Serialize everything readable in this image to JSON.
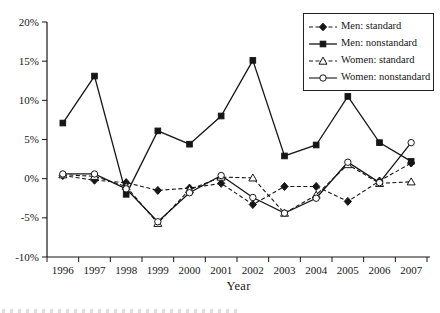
{
  "figure": {
    "x_axis_title": "Year"
  },
  "chart_data": {
    "type": "line",
    "title": "",
    "xlabel": "Year",
    "ylabel": "",
    "categories": [
      1996,
      1997,
      1998,
      1999,
      2000,
      2001,
      2002,
      2003,
      2004,
      2005,
      2006,
      2007
    ],
    "ylim": [
      -10,
      20
    ],
    "ytick_step": 5,
    "ytick_suffix": "%",
    "grid": false,
    "legend_position": "top-right",
    "color": "#161616",
    "series": [
      {
        "name": "Men: standard",
        "marker": "diamond",
        "fill": "filled",
        "line": "dashed",
        "values": [
          0.4,
          -0.2,
          -0.5,
          -1.5,
          -1.2,
          -0.6,
          -3.3,
          -1.0,
          -1.0,
          -2.9,
          -0.3,
          2.0
        ]
      },
      {
        "name": "Men: nonstandard",
        "marker": "square",
        "fill": "filled",
        "line": "solid",
        "values": [
          7.1,
          13.1,
          -2.0,
          6.1,
          4.4,
          8.0,
          15.1,
          2.9,
          4.3,
          10.5,
          4.6,
          2.2
        ]
      },
      {
        "name": "Women: standard",
        "marker": "triangle",
        "fill": "open",
        "line": "dashed",
        "values": [
          0.5,
          0.3,
          -1.0,
          -5.7,
          -1.4,
          0.2,
          0.1,
          -4.4,
          -2.1,
          1.8,
          -0.6,
          -0.4
        ]
      },
      {
        "name": "Women: nonstandard",
        "marker": "circle",
        "fill": "open",
        "line": "solid",
        "values": [
          0.6,
          0.6,
          -1.3,
          -5.5,
          -1.8,
          0.4,
          -2.4,
          -4.4,
          -2.5,
          2.1,
          -0.5,
          4.6
        ]
      }
    ]
  }
}
